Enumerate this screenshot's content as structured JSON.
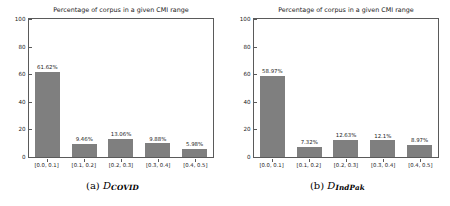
{
  "figure": {
    "background": "#ffffff",
    "bar_color": "#7f7f7f",
    "axis_color": "#5a5a5a",
    "text_color": "#1a1a1a"
  },
  "subfigures": [
    {
      "caption_tag": "(a)",
      "caption_symbol": "D",
      "caption_subscript": "COVID",
      "caption_full": "(a) D_COVID"
    },
    {
      "caption_tag": "(b)",
      "caption_symbol": "D",
      "caption_subscript": "IndPak",
      "caption_full": "(b) D_IndPak"
    }
  ],
  "chart_data": [
    {
      "type": "bar",
      "title": "Percentage of corpus in a given CMI range",
      "xlabel": "",
      "ylabel": "",
      "categories": [
        "[0.0, 0.1]",
        "[0.1, 0.2]",
        "[0.2, 0.3]",
        "[0.3, 0.4]",
        "[0.4, 0.5]"
      ],
      "values": [
        61.62,
        9.46,
        13.06,
        9.88,
        5.98
      ],
      "value_labels": [
        "61.62%",
        "9.46%",
        "13.06%",
        "9.88%",
        "5.98%"
      ],
      "ylim": [
        0,
        100
      ],
      "yticks": [
        0,
        20,
        40,
        60,
        80,
        100
      ],
      "ytick_labels": [
        "0",
        "20",
        "40",
        "60",
        "80",
        "100"
      ],
      "grid": false,
      "legend": null,
      "dataset": "D_COVID"
    },
    {
      "type": "bar",
      "title": "Percentage of corpus in a given CMI range",
      "xlabel": "",
      "ylabel": "",
      "categories": [
        "[0.0, 0.1]",
        "[0.1, 0.2]",
        "[0.2, 0.3]",
        "[0.3, 0.4]",
        "[0.4, 0.5]"
      ],
      "values": [
        58.97,
        7.32,
        12.63,
        12.1,
        8.97
      ],
      "value_labels": [
        "58.97%",
        "7.32%",
        "12.63%",
        "12.1%",
        "8.97%"
      ],
      "ylim": [
        0,
        100
      ],
      "yticks": [
        0,
        20,
        40,
        60,
        80,
        100
      ],
      "ytick_labels": [
        "0",
        "20",
        "40",
        "60",
        "80",
        "100"
      ],
      "grid": false,
      "legend": null,
      "dataset": "D_IndPak"
    }
  ]
}
